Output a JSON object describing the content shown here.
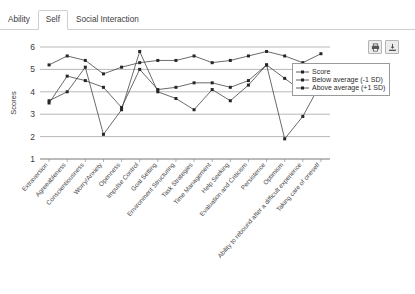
{
  "tabs": [
    {
      "label": "Ability",
      "active": false
    },
    {
      "label": "Self",
      "active": true
    },
    {
      "label": "Social Interaction",
      "active": false
    }
  ],
  "toolbar": {
    "print_icon": "printer-icon",
    "export_icon": "export-icon",
    "print_label": "Print",
    "export_label": "Export"
  },
  "legend": {
    "position": "top-right",
    "items": [
      {
        "label": "Score",
        "marker": "square"
      },
      {
        "label": "Below average (-1 SD)",
        "marker": "square"
      },
      {
        "label": "Above average (+1 SD)",
        "marker": "square"
      }
    ]
  },
  "chart_data": {
    "type": "line",
    "title": "",
    "xlabel": "",
    "ylabel": "Scores",
    "ylim": [
      1,
      6
    ],
    "yticks": [
      1,
      2,
      3,
      4,
      5,
      6
    ],
    "grid": true,
    "categories": [
      "Extraversion",
      "Agreeableness",
      "Conscientiousness",
      "Worry/Anxiety",
      "Openness",
      "Impulse Control",
      "Goal Setting",
      "Environment Structuring",
      "Task Strategies",
      "Time Management",
      "Help Seeking",
      "Evaluation and Criticism",
      "Persistence",
      "Optimism",
      "Ability to rebound after a difficult experience",
      "Taking care of oneself"
    ],
    "series": [
      {
        "name": "Score",
        "values": [
          3.6,
          4.0,
          5.1,
          2.1,
          3.2,
          5.8,
          4.0,
          3.7,
          3.2,
          4.1,
          3.6,
          4.3,
          5.2,
          1.9,
          2.9,
          4.4
        ]
      },
      {
        "name": "Below average (-1 SD)",
        "values": [
          3.5,
          4.7,
          4.5,
          4.2,
          3.3,
          5.0,
          4.1,
          4.2,
          4.4,
          4.4,
          4.2,
          4.5,
          5.2,
          4.6,
          4.0,
          4.1
        ]
      },
      {
        "name": "Above average (+1 SD)",
        "values": [
          5.2,
          5.6,
          5.4,
          4.8,
          5.1,
          5.3,
          5.4,
          5.4,
          5.6,
          5.3,
          5.4,
          5.6,
          5.8,
          5.6,
          5.3,
          5.7
        ]
      }
    ]
  }
}
